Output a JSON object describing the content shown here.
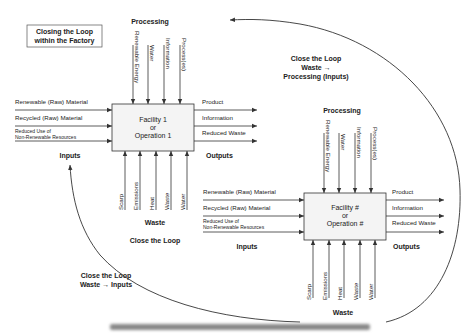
{
  "title_box": {
    "line1": "Closing the Loop",
    "line2": "within the Factory"
  },
  "facility1": {
    "line1": "Facility 1",
    "line2": "or",
    "line3": "Operation 1",
    "processing_label": "Processing",
    "processing_items": [
      "Renewable Energy",
      "Water",
      "Information",
      "Process(es)"
    ],
    "inputs_label": "Inputs",
    "inputs": [
      "Renewable (Raw) Material",
      "Recycled (Raw) Material"
    ],
    "input_reduced_line1": "Reduced Use of",
    "input_reduced_line2": "Non-Renewable Resources",
    "outputs_label": "Outputs",
    "outputs": [
      "Product",
      "Information",
      "Reduced Waste"
    ],
    "waste_label": "Waste",
    "waste_items": [
      "Scarp",
      "Emissions",
      "Heat",
      "Waste",
      "Water"
    ]
  },
  "facility2": {
    "line1": "Facility #",
    "line2": "or",
    "line3": "Operation #",
    "processing_label": "Processing",
    "processing_items": [
      "Renewable Energy",
      "Water",
      "Information",
      "Process(es)"
    ],
    "inputs_label": "Inputs",
    "inputs": [
      "Renewable (Raw) Material",
      "Recycled (Raw) Material"
    ],
    "input_reduced_line1": "Reduced Use of",
    "input_reduced_line2": "Non-Renewable Resources",
    "outputs_label": "Outputs",
    "outputs": [
      "Product",
      "Information",
      "Reduced Waste"
    ],
    "waste_label": "Waste",
    "waste_items": [
      "Scarp",
      "Emissions",
      "Heat",
      "Waste",
      "Water"
    ]
  },
  "loops": {
    "close_the_loop": "Close the Loop",
    "to_processing_line1": "Close the Loop",
    "to_processing_line2": "Waste →",
    "to_processing_line3": "Processing (Inputs)",
    "to_inputs_line1": "Close the Loop",
    "to_inputs_line2": "Waste → Inputs"
  },
  "colors": {
    "line": "#333333",
    "box_fill": "#f4f4f4",
    "text": "#222222"
  }
}
